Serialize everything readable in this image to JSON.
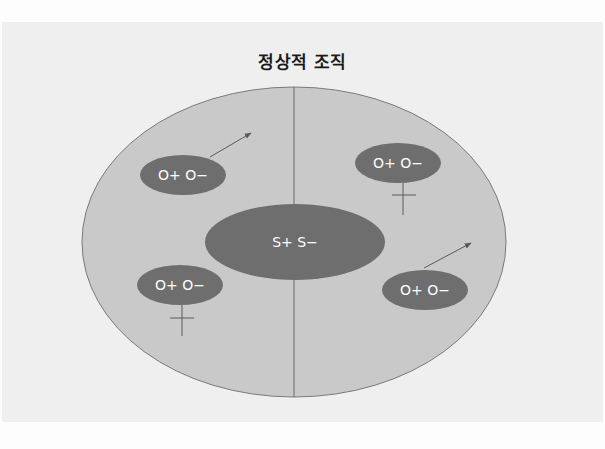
{
  "title": "정상적 조직",
  "colors": {
    "background": "#fdfdfd",
    "panel": "#efefef",
    "outer_ellipse_fill": "#c9c9c9",
    "outer_ellipse_stroke": "#7a7a7a",
    "inner_ellipse_fill": "#6e6e6e",
    "line": "#6a6a6a",
    "label_text": "#ffffff"
  },
  "outer_ellipse": {
    "cx": 294,
    "cy": 242,
    "rx": 212,
    "ry": 155
  },
  "divider": {
    "x": 294,
    "y1": 87,
    "y2": 397
  },
  "center_node": {
    "label": "S+ S−",
    "cx": 295,
    "cy": 242,
    "rx": 90,
    "ry": 38
  },
  "nodes": [
    {
      "id": "top-left",
      "label": "O+ O−",
      "cx": 183,
      "cy": 175,
      "rx": 43,
      "ry": 20,
      "marker": "arrow"
    },
    {
      "id": "top-right",
      "label": "O+ O−",
      "cx": 398,
      "cy": 163,
      "rx": 43,
      "ry": 20,
      "marker": "cross"
    },
    {
      "id": "bottom-left",
      "label": "O+ O−",
      "cx": 180,
      "cy": 285,
      "rx": 43,
      "ry": 20,
      "marker": "cross"
    },
    {
      "id": "bottom-right",
      "label": "O+ O−",
      "cx": 425,
      "cy": 290,
      "rx": 43,
      "ry": 20,
      "marker": "arrow"
    }
  ]
}
